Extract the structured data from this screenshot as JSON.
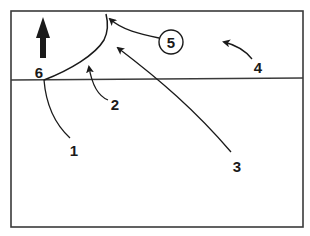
{
  "diagram": {
    "frame": {
      "x": 11,
      "y": 11,
      "width": 292,
      "height": 216,
      "stroke": "#3a3a3a"
    },
    "horizon_line": {
      "x1": 11,
      "y1": 80,
      "x2": 303,
      "y2": 78,
      "stroke": "#3a3a3a"
    },
    "colors": {
      "ink": "#1a1a1a",
      "background": "#ffffff"
    },
    "labels": [
      {
        "id": "1",
        "text": "1",
        "x": 72,
        "y": 156
      },
      {
        "id": "2",
        "text": "2",
        "x": 112,
        "y": 110
      },
      {
        "id": "3",
        "text": "3",
        "x": 234,
        "y": 172
      },
      {
        "id": "4",
        "text": "4",
        "x": 254,
        "y": 74
      },
      {
        "id": "5",
        "text": "5",
        "x": 171,
        "y": 47
      },
      {
        "id": "6",
        "text": "6",
        "x": 39,
        "y": 78
      }
    ],
    "circled_label": {
      "text": "5",
      "cx": 171,
      "cy": 42,
      "r": 12
    },
    "north_arrow": {
      "label": "up-arrow",
      "x": 43,
      "y_top": 17,
      "y_bottom": 58
    }
  }
}
